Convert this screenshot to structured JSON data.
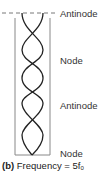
{
  "figure": {
    "labels": [
      {
        "text": "Antinode",
        "top": 9
      },
      {
        "text": "Node",
        "top": 56
      },
      {
        "text": "Antinode",
        "top": 101
      },
      {
        "text": "Node",
        "top": 149
      }
    ],
    "caption": {
      "tag": "(b)",
      "text": "Frequency = 5f",
      "subscript": "0"
    },
    "colors": {
      "tube": "#888888",
      "wave": "#222222",
      "dash": "#555555"
    }
  }
}
